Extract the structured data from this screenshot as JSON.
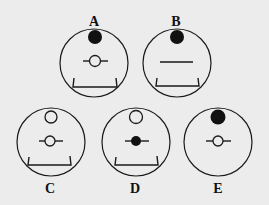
{
  "figure": {
    "background": "#ececec",
    "stroke_color": "#1a1a1a",
    "panels": [
      {
        "label": "A",
        "cx": 94,
        "cy": 63,
        "r": 34,
        "label_x": 94,
        "label_y": 26,
        "top_dot": "filled",
        "middle": "hollow-ball-on-rod",
        "bracket": true
      },
      {
        "label": "B",
        "cx": 177,
        "cy": 63,
        "r": 34,
        "label_x": 176,
        "label_y": 26,
        "top_dot": "filled",
        "middle": "rod-only",
        "bracket": true
      },
      {
        "label": "C",
        "cx": 51,
        "cy": 142,
        "r": 34,
        "label_x": 50,
        "label_y": 193,
        "top_dot": "hollow",
        "middle": "hollow-ball-on-rod",
        "bracket": true
      },
      {
        "label": "D",
        "cx": 136,
        "cy": 142,
        "r": 34,
        "label_x": 135,
        "label_y": 193,
        "top_dot": "hollow",
        "middle": "filled-ball-on-rod",
        "bracket": true
      },
      {
        "label": "E",
        "cx": 218,
        "cy": 142,
        "r": 34,
        "label_x": 218,
        "label_y": 193,
        "top_dot": "filled",
        "middle": "hollow-ball-on-rod",
        "bracket": false
      }
    ]
  }
}
